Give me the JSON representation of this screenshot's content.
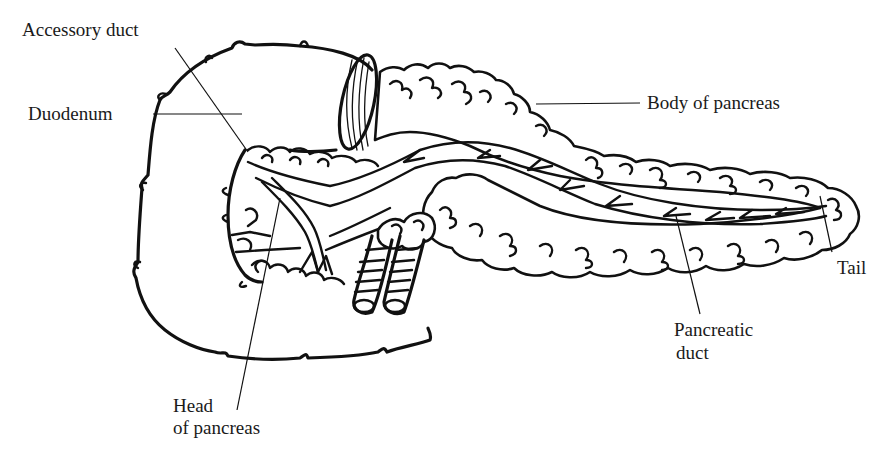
{
  "diagram": {
    "type": "anatomical line drawing",
    "colors": {
      "ink": "#111111",
      "background": "#ffffff",
      "text": "#1a1a1a"
    },
    "labels": {
      "accessory_duct": "Accessory duct",
      "duodenum": "Duodenum",
      "body_of_pancreas": "Body of pancreas",
      "tail": "Tail",
      "pancreatic_duct_line1": "Pancreatic",
      "pancreatic_duct_line2": "duct",
      "head_line1": "Head",
      "head_line2": "of pancreas"
    },
    "structures": [
      "duodenum",
      "accessory duct",
      "body of pancreas",
      "tail",
      "pancreatic duct",
      "head of pancreas",
      "blood vessels"
    ]
  }
}
